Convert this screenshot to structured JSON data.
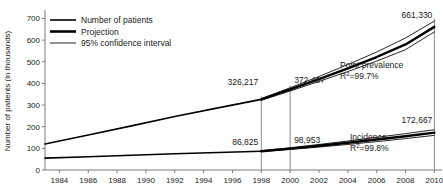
{
  "chart_data": {
    "type": "line",
    "title": "",
    "xlabel": "",
    "ylabel": "Number of patients (in thousands)",
    "xlim": [
      1983,
      2010.6
    ],
    "ylim": [
      0,
      730
    ],
    "grid": false,
    "legend_position": "top-left",
    "x_ticks": [
      1984,
      1986,
      1988,
      1990,
      1992,
      1994,
      1996,
      1998,
      2000,
      2002,
      2004,
      2006,
      2008,
      2010
    ],
    "y_ticks": [
      0,
      100,
      200,
      300,
      400,
      500,
      600,
      700
    ],
    "series": [
      {
        "name": "Point prevalence",
        "kind": "observed",
        "x": [
          1983,
          1986,
          1989,
          1992,
          1995,
          1998
        ],
        "values": [
          120,
          162,
          204,
          247,
          287,
          326.217
        ]
      },
      {
        "name": "Point prevalence",
        "kind": "projection",
        "x": [
          1998,
          2000,
          2002,
          2004,
          2006,
          2008,
          2010
        ],
        "values": [
          326.217,
          372.407,
          420,
          470,
          522,
          580,
          661.33
        ]
      },
      {
        "name": "Point prevalence",
        "kind": "ci-upper",
        "x": [
          1998,
          2000,
          2002,
          2004,
          2006,
          2008,
          2010
        ],
        "values": [
          330,
          380,
          432,
          487,
          545,
          610,
          688
        ]
      },
      {
        "name": "Point prevalence",
        "kind": "ci-lower",
        "x": [
          1998,
          2000,
          2002,
          2004,
          2006,
          2008,
          2010
        ],
        "values": [
          322,
          365,
          409,
          455,
          503,
          556,
          638
        ]
      },
      {
        "name": "Incidence",
        "kind": "observed",
        "x": [
          1983,
          1986,
          1989,
          1992,
          1995,
          1998
        ],
        "values": [
          55,
          61,
          68,
          75,
          81,
          86.825
        ]
      },
      {
        "name": "Incidence",
        "kind": "projection",
        "x": [
          1998,
          2000,
          2002,
          2004,
          2006,
          2008,
          2010
        ],
        "values": [
          86.825,
          98.953,
          112,
          126,
          141,
          156,
          172.667
        ]
      },
      {
        "name": "Incidence",
        "kind": "ci-upper",
        "x": [
          1998,
          2000,
          2002,
          2004,
          2006,
          2008,
          2010
        ],
        "values": [
          89,
          103,
          118,
          134,
          151,
          168,
          186
        ]
      },
      {
        "name": "Incidence",
        "kind": "ci-lower",
        "x": [
          1998,
          2000,
          2002,
          2004,
          2006,
          2008,
          2010
        ],
        "values": [
          85,
          95,
          106,
          118,
          131,
          145,
          160
        ]
      }
    ],
    "reference_lines": [
      1998,
      2000,
      2010
    ],
    "data_labels": [
      {
        "id": "prev-1998",
        "text": "326,217",
        "x": 1998,
        "y": 326.217
      },
      {
        "id": "prev-2000",
        "text": "372,407",
        "x": 2000,
        "y": 372.407
      },
      {
        "id": "prev-2010",
        "text": "661,330",
        "x": 2010,
        "y": 661.33
      },
      {
        "id": "inc-1998",
        "text": "86,825",
        "x": 1998,
        "y": 86.825
      },
      {
        "id": "inc-2000",
        "text": "98,953",
        "x": 2000,
        "y": 98.953
      },
      {
        "id": "inc-2010",
        "text": "172,667",
        "x": 2010,
        "y": 172.667
      }
    ],
    "annotations": [
      {
        "id": "point-prevalence",
        "label": "Point prevalence",
        "stat_base": "R",
        "stat_sup": "2",
        "stat_rest": "=99.7%"
      },
      {
        "id": "incidence",
        "label": "Incidence",
        "stat_base": "R",
        "stat_sup": "2",
        "stat_rest": "=99.8%"
      }
    ]
  },
  "legend": {
    "items": [
      {
        "label": "Number of patients",
        "style": "observed"
      },
      {
        "label": "Projection",
        "style": "projection"
      },
      {
        "label": "95% confidence interval",
        "style": "ci"
      }
    ]
  },
  "axes": {
    "y_title": "Number of patients (in thousands)",
    "y_tick_labels": [
      "0",
      "100",
      "200",
      "300",
      "400",
      "500",
      "600",
      "700"
    ],
    "x_tick_labels": [
      "1984",
      "1986",
      "1988",
      "1990",
      "1992",
      "1994",
      "1996",
      "1998",
      "2000",
      "2002",
      "2004",
      "2006",
      "2008",
      "2010"
    ]
  },
  "colors": {
    "line": "#000000",
    "axis": "#7a7a7a",
    "reference_line": "#8c8c8c",
    "text": "#1a1a1a",
    "background": "#ffffff"
  }
}
